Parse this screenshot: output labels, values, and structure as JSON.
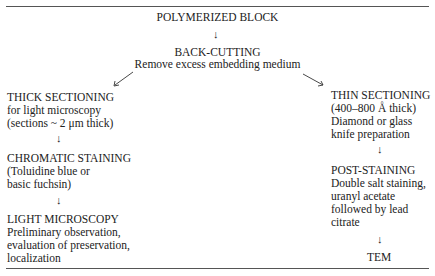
{
  "diagram": {
    "root": {
      "title": "POLYMERIZED BLOCK"
    },
    "back_cutting": {
      "title": "BACK-CUTTING",
      "desc": "Remove excess embedding medium"
    },
    "left_branch": [
      {
        "title": "THICK SECTIONING",
        "lines": [
          "for light microscopy",
          "(sections ~ 2 μm thick)"
        ]
      },
      {
        "title": "CHROMATIC STAINING",
        "lines": [
          "(Toluidine blue or",
          "basic fuchsin)"
        ]
      },
      {
        "title": "LIGHT MICROSCOPY",
        "lines": [
          "Preliminary observation,",
          "evaluation of preservation,",
          "localization"
        ]
      }
    ],
    "right_branch": [
      {
        "title": "THIN SECTIONING",
        "lines": [
          "(400–800 Å thick)",
          "Diamond or glass",
          "knife preparation"
        ]
      },
      {
        "title": "POST-STAINING",
        "lines": [
          "Double salt staining,",
          "uranyl acetate",
          "followed by lead",
          "citrate"
        ]
      },
      {
        "title": "TEM"
      }
    ],
    "arrow_glyph": "↓"
  }
}
